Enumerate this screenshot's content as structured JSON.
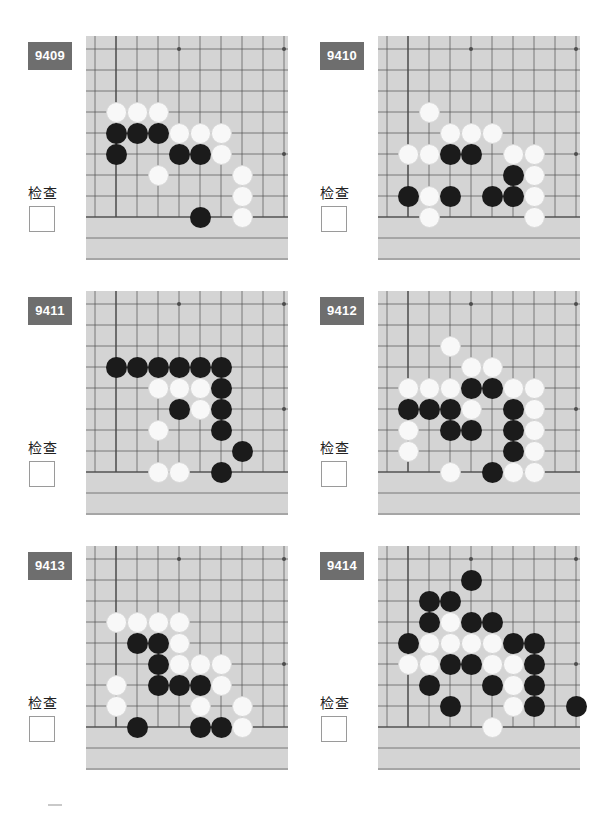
{
  "page": {
    "background_color": "#ffffff",
    "badge_color": "#6e6e6e",
    "board_color": "#d4d4d4",
    "line_color": "#4d4d4d",
    "black_stone_color": "#1b1b1b",
    "white_stone_color": "#f8f8f8",
    "columns": 2,
    "rows": 3
  },
  "board_geometry": {
    "cols": 9,
    "rows": 9,
    "cell": 21,
    "origin_x": 30,
    "origin_y": 13,
    "star_points": [
      [
        3,
        1
      ],
      [
        8,
        1
      ],
      [
        8,
        6
      ]
    ]
  },
  "check": {
    "label": "检查",
    "checked": false
  },
  "puzzles": [
    {
      "id": "9409",
      "label": "9409",
      "check_label": "检查",
      "checked": false,
      "stones": [
        {
          "color": "white",
          "col": 1,
          "row": 4
        },
        {
          "color": "white",
          "col": 2,
          "row": 4
        },
        {
          "color": "white",
          "col": 3,
          "row": 4
        },
        {
          "color": "black",
          "col": 1,
          "row": 5
        },
        {
          "color": "black",
          "col": 2,
          "row": 5
        },
        {
          "color": "black",
          "col": 3,
          "row": 5
        },
        {
          "color": "white",
          "col": 4,
          "row": 5
        },
        {
          "color": "white",
          "col": 5,
          "row": 5
        },
        {
          "color": "white",
          "col": 6,
          "row": 5
        },
        {
          "color": "black",
          "col": 1,
          "row": 6
        },
        {
          "color": "black",
          "col": 4,
          "row": 6
        },
        {
          "color": "black",
          "col": 5,
          "row": 6
        },
        {
          "color": "white",
          "col": 6,
          "row": 6
        },
        {
          "color": "white",
          "col": 3,
          "row": 7
        },
        {
          "color": "white",
          "col": 7,
          "row": 7
        },
        {
          "color": "white",
          "col": 7,
          "row": 8
        },
        {
          "color": "black",
          "col": 5,
          "row": 9
        },
        {
          "color": "white",
          "col": 7,
          "row": 9
        }
      ]
    },
    {
      "id": "9410",
      "label": "9410",
      "check_label": "检查",
      "checked": false,
      "stones": [
        {
          "color": "white",
          "col": 2,
          "row": 4
        },
        {
          "color": "white",
          "col": 3,
          "row": 5
        },
        {
          "color": "white",
          "col": 4,
          "row": 5
        },
        {
          "color": "white",
          "col": 5,
          "row": 5
        },
        {
          "color": "white",
          "col": 1,
          "row": 6
        },
        {
          "color": "white",
          "col": 2,
          "row": 6
        },
        {
          "color": "black",
          "col": 3,
          "row": 6
        },
        {
          "color": "black",
          "col": 4,
          "row": 6
        },
        {
          "color": "white",
          "col": 6,
          "row": 6
        },
        {
          "color": "white",
          "col": 7,
          "row": 6
        },
        {
          "color": "black",
          "col": 6,
          "row": 7
        },
        {
          "color": "white",
          "col": 7,
          "row": 7
        },
        {
          "color": "black",
          "col": 1,
          "row": 8
        },
        {
          "color": "white",
          "col": 2,
          "row": 8
        },
        {
          "color": "black",
          "col": 3,
          "row": 8
        },
        {
          "color": "black",
          "col": 5,
          "row": 8
        },
        {
          "color": "black",
          "col": 6,
          "row": 8
        },
        {
          "color": "white",
          "col": 7,
          "row": 8
        },
        {
          "color": "white",
          "col": 2,
          "row": 9
        },
        {
          "color": "white",
          "col": 7,
          "row": 9
        }
      ]
    },
    {
      "id": "9411",
      "label": "9411",
      "check_label": "检查",
      "checked": false,
      "stones": [
        {
          "color": "black",
          "col": 1,
          "row": 4
        },
        {
          "color": "black",
          "col": 2,
          "row": 4
        },
        {
          "color": "black",
          "col": 3,
          "row": 4
        },
        {
          "color": "black",
          "col": 4,
          "row": 4
        },
        {
          "color": "black",
          "col": 5,
          "row": 4
        },
        {
          "color": "black",
          "col": 6,
          "row": 4
        },
        {
          "color": "white",
          "col": 3,
          "row": 5
        },
        {
          "color": "white",
          "col": 4,
          "row": 5
        },
        {
          "color": "white",
          "col": 5,
          "row": 5
        },
        {
          "color": "black",
          "col": 6,
          "row": 5
        },
        {
          "color": "black",
          "col": 4,
          "row": 6
        },
        {
          "color": "white",
          "col": 5,
          "row": 6
        },
        {
          "color": "black",
          "col": 6,
          "row": 6
        },
        {
          "color": "white",
          "col": 3,
          "row": 7
        },
        {
          "color": "black",
          "col": 6,
          "row": 7
        },
        {
          "color": "black",
          "col": 7,
          "row": 8
        },
        {
          "color": "white",
          "col": 3,
          "row": 9
        },
        {
          "color": "white",
          "col": 4,
          "row": 9
        },
        {
          "color": "black",
          "col": 6,
          "row": 9
        }
      ]
    },
    {
      "id": "9412",
      "label": "9412",
      "check_label": "检查",
      "checked": false,
      "stones": [
        {
          "color": "white",
          "col": 3,
          "row": 3
        },
        {
          "color": "white",
          "col": 4,
          "row": 4
        },
        {
          "color": "white",
          "col": 5,
          "row": 4
        },
        {
          "color": "white",
          "col": 1,
          "row": 5
        },
        {
          "color": "white",
          "col": 2,
          "row": 5
        },
        {
          "color": "white",
          "col": 3,
          "row": 5
        },
        {
          "color": "black",
          "col": 4,
          "row": 5
        },
        {
          "color": "black",
          "col": 5,
          "row": 5
        },
        {
          "color": "white",
          "col": 6,
          "row": 5
        },
        {
          "color": "white",
          "col": 7,
          "row": 5
        },
        {
          "color": "black",
          "col": 1,
          "row": 6
        },
        {
          "color": "black",
          "col": 2,
          "row": 6
        },
        {
          "color": "black",
          "col": 3,
          "row": 6
        },
        {
          "color": "white",
          "col": 4,
          "row": 6
        },
        {
          "color": "black",
          "col": 6,
          "row": 6
        },
        {
          "color": "white",
          "col": 7,
          "row": 6
        },
        {
          "color": "white",
          "col": 1,
          "row": 7
        },
        {
          "color": "black",
          "col": 3,
          "row": 7
        },
        {
          "color": "black",
          "col": 4,
          "row": 7
        },
        {
          "color": "black",
          "col": 6,
          "row": 7
        },
        {
          "color": "white",
          "col": 7,
          "row": 7
        },
        {
          "color": "white",
          "col": 1,
          "row": 8
        },
        {
          "color": "black",
          "col": 6,
          "row": 8
        },
        {
          "color": "white",
          "col": 7,
          "row": 8
        },
        {
          "color": "white",
          "col": 3,
          "row": 9
        },
        {
          "color": "black",
          "col": 5,
          "row": 9
        },
        {
          "color": "white",
          "col": 6,
          "row": 9
        },
        {
          "color": "white",
          "col": 7,
          "row": 9
        }
      ]
    },
    {
      "id": "9413",
      "label": "9413",
      "check_label": "检查",
      "checked": false,
      "stones": [
        {
          "color": "white",
          "col": 1,
          "row": 4
        },
        {
          "color": "white",
          "col": 2,
          "row": 4
        },
        {
          "color": "white",
          "col": 3,
          "row": 4
        },
        {
          "color": "white",
          "col": 4,
          "row": 4
        },
        {
          "color": "black",
          "col": 2,
          "row": 5
        },
        {
          "color": "black",
          "col": 3,
          "row": 5
        },
        {
          "color": "white",
          "col": 4,
          "row": 5
        },
        {
          "color": "black",
          "col": 3,
          "row": 6
        },
        {
          "color": "white",
          "col": 4,
          "row": 6
        },
        {
          "color": "white",
          "col": 5,
          "row": 6
        },
        {
          "color": "white",
          "col": 6,
          "row": 6
        },
        {
          "color": "white",
          "col": 1,
          "row": 7
        },
        {
          "color": "black",
          "col": 3,
          "row": 7
        },
        {
          "color": "black",
          "col": 4,
          "row": 7
        },
        {
          "color": "black",
          "col": 5,
          "row": 7
        },
        {
          "color": "white",
          "col": 6,
          "row": 7
        },
        {
          "color": "white",
          "col": 1,
          "row": 8
        },
        {
          "color": "white",
          "col": 5,
          "row": 8
        },
        {
          "color": "white",
          "col": 7,
          "row": 8
        },
        {
          "color": "black",
          "col": 2,
          "row": 9
        },
        {
          "color": "black",
          "col": 5,
          "row": 9
        },
        {
          "color": "black",
          "col": 6,
          "row": 9
        },
        {
          "color": "white",
          "col": 7,
          "row": 9
        }
      ]
    },
    {
      "id": "9414",
      "label": "9414",
      "check_label": "检查",
      "checked": false,
      "stones": [
        {
          "color": "black",
          "col": 4,
          "row": 2
        },
        {
          "color": "black",
          "col": 2,
          "row": 3
        },
        {
          "color": "black",
          "col": 3,
          "row": 3
        },
        {
          "color": "black",
          "col": 2,
          "row": 4
        },
        {
          "color": "white",
          "col": 3,
          "row": 4
        },
        {
          "color": "black",
          "col": 4,
          "row": 4
        },
        {
          "color": "black",
          "col": 5,
          "row": 4
        },
        {
          "color": "black",
          "col": 1,
          "row": 5
        },
        {
          "color": "white",
          "col": 2,
          "row": 5
        },
        {
          "color": "white",
          "col": 3,
          "row": 5
        },
        {
          "color": "white",
          "col": 4,
          "row": 5
        },
        {
          "color": "white",
          "col": 5,
          "row": 5
        },
        {
          "color": "black",
          "col": 6,
          "row": 5
        },
        {
          "color": "black",
          "col": 7,
          "row": 5
        },
        {
          "color": "white",
          "col": 1,
          "row": 6
        },
        {
          "color": "white",
          "col": 2,
          "row": 6
        },
        {
          "color": "black",
          "col": 3,
          "row": 6
        },
        {
          "color": "black",
          "col": 4,
          "row": 6
        },
        {
          "color": "white",
          "col": 5,
          "row": 6
        },
        {
          "color": "white",
          "col": 6,
          "row": 6
        },
        {
          "color": "black",
          "col": 7,
          "row": 6
        },
        {
          "color": "black",
          "col": 2,
          "row": 7
        },
        {
          "color": "black",
          "col": 5,
          "row": 7
        },
        {
          "color": "white",
          "col": 6,
          "row": 7
        },
        {
          "color": "black",
          "col": 7,
          "row": 7
        },
        {
          "color": "black",
          "col": 3,
          "row": 8
        },
        {
          "color": "white",
          "col": 6,
          "row": 8
        },
        {
          "color": "black",
          "col": 7,
          "row": 8
        },
        {
          "color": "black",
          "col": 9,
          "row": 8
        },
        {
          "color": "white",
          "col": 5,
          "row": 9
        }
      ]
    }
  ]
}
